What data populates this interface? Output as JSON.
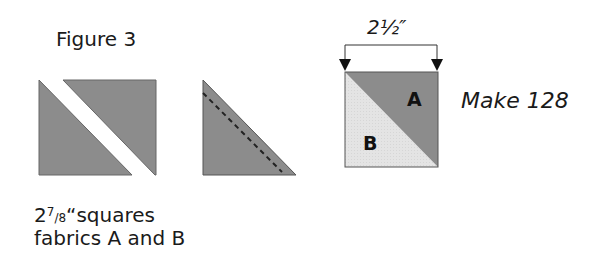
{
  "figure": {
    "title": "Figure 3",
    "caption": {
      "line1_whole": "2",
      "line1_num": "7",
      "line1_slash": "/",
      "line1_den": "8",
      "line1_rest": "“squares",
      "line2": "fabrics A and B"
    },
    "dimension_label": "2½″",
    "make_label": "Make 128",
    "block_labels": {
      "a": "A",
      "b": "B"
    },
    "colors": {
      "dark_fabric": "#8c8c8c",
      "light_fabric": "#e6e6e6",
      "outline": "#555555",
      "seam_line": "#222222"
    },
    "steps": [
      "Cut square on diagonal",
      "Sew along dashed seam line",
      "Half-square triangle unit A/B"
    ]
  }
}
